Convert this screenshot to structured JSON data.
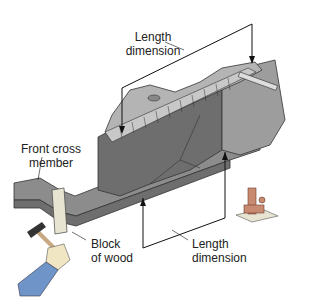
{
  "diagram": {
    "labels": {
      "length_top": [
        "Length",
        "dimension"
      ],
      "front_cross": [
        "Front cross",
        "member"
      ],
      "block_wood": [
        "Block",
        "of wood"
      ],
      "length_bottom": [
        "Length",
        "dimension"
      ]
    },
    "colors": {
      "frame_dark": "#6e6e6e",
      "frame_mid": "#8c8c8c",
      "frame_light": "#b4b4b4",
      "wood": "#e8e4d2",
      "jack": "#c98a72",
      "sleeve": "#6f95c8",
      "hand": "#f1e6c4",
      "lines": "#111111"
    }
  }
}
